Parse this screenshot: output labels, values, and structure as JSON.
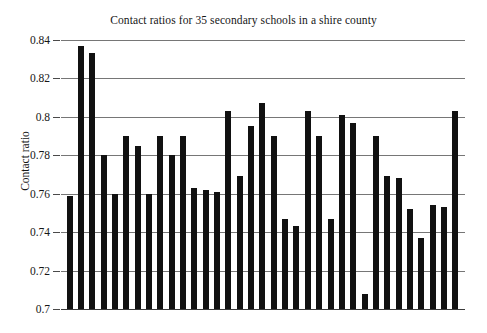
{
  "chart_data": {
    "type": "bar",
    "title": "Contact ratios for 35 secondary schools in a shire county",
    "xlabel": "",
    "ylabel": "Contact ratio",
    "ylim": [
      0.7,
      0.84
    ],
    "ytick_labels": [
      "0.84",
      "0.82",
      "0.8",
      "0.78",
      "0.76",
      "0.74",
      "0.72",
      "0.7"
    ],
    "ytick_values": [
      0.84,
      0.82,
      0.8,
      0.78,
      0.76,
      0.74,
      0.72,
      0.7
    ],
    "grid": true,
    "legend": null,
    "n_bars": 35,
    "bar_color": "#111111",
    "categories": [
      "1",
      "2",
      "3",
      "4",
      "5",
      "6",
      "7",
      "8",
      "9",
      "10",
      "11",
      "12",
      "13",
      "14",
      "15",
      "16",
      "17",
      "18",
      "19",
      "20",
      "21",
      "22",
      "23",
      "24",
      "25",
      "26",
      "27",
      "28",
      "29",
      "30",
      "31",
      "32",
      "33",
      "34",
      "35"
    ],
    "values": [
      0.759,
      0.837,
      0.833,
      0.78,
      0.76,
      0.79,
      0.785,
      0.76,
      0.79,
      0.78,
      0.79,
      0.763,
      0.762,
      0.761,
      0.803,
      0.769,
      0.795,
      0.807,
      0.79,
      0.747,
      0.743,
      0.803,
      0.79,
      0.747,
      0.801,
      0.797,
      0.708,
      0.79,
      0.769,
      0.768,
      0.752,
      0.737,
      0.754,
      0.753,
      0.803
    ]
  },
  "bottom_caption": ""
}
